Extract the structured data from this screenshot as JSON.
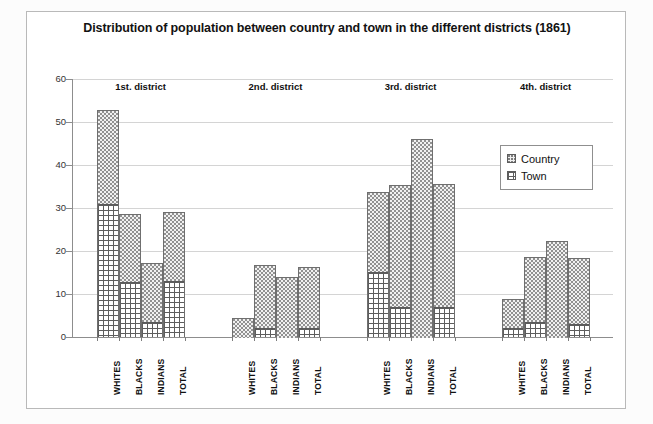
{
  "chart": {
    "title": "Distribution of population between country and town in the different districts (1861)",
    "y_axis_title": "Distribution in %",
    "y_ticks": [
      "0",
      "10",
      "20",
      "30",
      "40",
      "50",
      "60"
    ],
    "group_headers": [
      "1st. district",
      "2nd. district",
      "3rd. district",
      "4th. district"
    ],
    "categories": [
      "WHITES",
      "BLACKS",
      "INDIANS",
      "TOTAL"
    ],
    "legend": {
      "country_label": "Country",
      "town_label": "Town",
      "country_swatch": "dotted-pattern-icon",
      "town_swatch": "brick-pattern-icon"
    }
  },
  "chart_data": {
    "type": "bar",
    "subtype": "stacked-grouped-bar",
    "title": "Distribution of population between country and town in the different districts (1861)",
    "xlabel": "",
    "ylabel": "Distribution in %",
    "ylim": [
      0,
      60
    ],
    "ytick_interval": 10,
    "grid": true,
    "legend_position": "inside-upper-right",
    "groups": [
      "1st. district",
      "2nd. district",
      "3rd. district",
      "4th. district"
    ],
    "categories": [
      "WHITES",
      "BLACKS",
      "INDIANS",
      "TOTAL"
    ],
    "series": [
      {
        "name": "Town",
        "values": [
          [
            31.0,
            12.8,
            3.4,
            13.0
          ],
          [
            0.0,
            2.0,
            0.0,
            2.0
          ],
          [
            15.2,
            7.0,
            0.0,
            7.0
          ],
          [
            2.0,
            3.5,
            0.0,
            3.0
          ]
        ]
      },
      {
        "name": "Country",
        "values": [
          [
            21.8,
            15.8,
            13.9,
            16.0
          ],
          [
            4.4,
            14.8,
            14.0,
            14.2
          ],
          [
            18.6,
            28.3,
            46.0,
            28.5
          ],
          [
            6.8,
            15.2,
            22.3,
            15.4
          ]
        ]
      }
    ],
    "totals": [
      [
        52.8,
        28.6,
        17.3,
        29.0
      ],
      [
        4.4,
        16.8,
        14.0,
        16.2
      ],
      [
        33.8,
        35.3,
        46.0,
        35.5
      ],
      [
        8.8,
        18.7,
        22.3,
        18.4
      ]
    ]
  }
}
